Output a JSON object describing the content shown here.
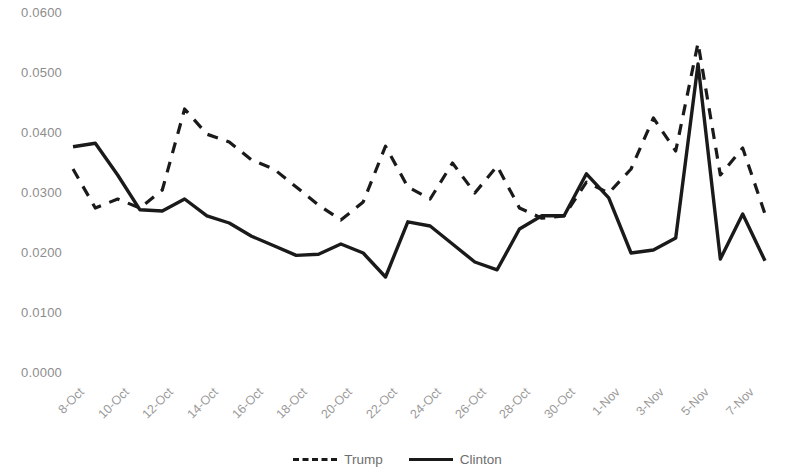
{
  "chart_data": {
    "type": "line",
    "title": "",
    "subtitle": "",
    "xlabel": "",
    "ylabel": "",
    "ylim": [
      0.0,
      0.06
    ],
    "ytick_labels": [
      "0.0600",
      "0.0500",
      "0.0400",
      "0.0300",
      "0.0200",
      "0.0100",
      "0.0000"
    ],
    "ytick_values": [
      0.06,
      0.05,
      0.04,
      0.03,
      0.02,
      0.01,
      0.0
    ],
    "grid": false,
    "legend_position": "bottom-center",
    "x": [
      "8-Oct",
      "9-Oct",
      "10-Oct",
      "11-Oct",
      "12-Oct",
      "13-Oct",
      "14-Oct",
      "15-Oct",
      "16-Oct",
      "17-Oct",
      "18-Oct",
      "19-Oct",
      "20-Oct",
      "21-Oct",
      "22-Oct",
      "23-Oct",
      "24-Oct",
      "25-Oct",
      "26-Oct",
      "27-Oct",
      "28-Oct",
      "29-Oct",
      "30-Oct",
      "31-Oct",
      "1-Nov",
      "2-Nov",
      "3-Nov",
      "4-Nov",
      "5-Nov",
      "6-Nov",
      "7-Nov",
      "8-Nov"
    ],
    "xtick_labels": [
      "8-Oct",
      "10-Oct",
      "12-Oct",
      "14-Oct",
      "16-Oct",
      "18-Oct",
      "20-Oct",
      "22-Oct",
      "24-Oct",
      "26-Oct",
      "28-Oct",
      "30-Oct",
      "1-Nov",
      "3-Nov",
      "5-Nov",
      "7-Nov"
    ],
    "series": [
      {
        "name": "Trump",
        "style": "dashed",
        "color": "#1a1a1a",
        "values": [
          0.034,
          0.0275,
          0.029,
          0.0275,
          0.0305,
          0.044,
          0.0398,
          0.0385,
          0.0355,
          0.034,
          0.031,
          0.028,
          0.0255,
          0.0285,
          0.0378,
          0.031,
          0.029,
          0.035,
          0.03,
          0.0345,
          0.0275,
          0.0258,
          0.0262,
          0.0318,
          0.03,
          0.034,
          0.0425,
          0.037,
          0.055,
          0.033,
          0.0375,
          0.0265
        ]
      },
      {
        "name": "Clinton",
        "style": "solid",
        "color": "#1a1a1a",
        "values": [
          0.0377,
          0.0383,
          0.033,
          0.0272,
          0.027,
          0.029,
          0.0262,
          0.025,
          0.0228,
          0.0212,
          0.0196,
          0.0198,
          0.0215,
          0.02,
          0.016,
          0.0252,
          0.0245,
          0.0215,
          0.0185,
          0.0172,
          0.024,
          0.0262,
          0.0262,
          0.0332,
          0.0292,
          0.02,
          0.0205,
          0.0225,
          0.0515,
          0.019,
          0.0265,
          0.0187
        ]
      }
    ]
  },
  "legend": {
    "entries": [
      {
        "label": "Trump",
        "style": "dashed"
      },
      {
        "label": "Clinton",
        "style": "solid"
      }
    ]
  }
}
